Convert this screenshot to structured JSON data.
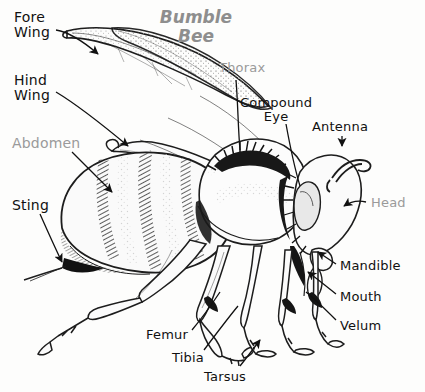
{
  "diagram": {
    "title": "Bumble\nBee",
    "title_color": "#8e8e8e",
    "style": "pen-and-ink line drawing, black on white"
  },
  "labels": [
    {
      "id": "fore-wing",
      "text": "Fore\nWing",
      "color": "#111111",
      "x": 14,
      "y": 10,
      "size": 14,
      "align": "left"
    },
    {
      "id": "hind-wing",
      "text": "Hind\nWing",
      "color": "#111111",
      "x": 14,
      "y": 73,
      "size": 14,
      "align": "left"
    },
    {
      "id": "abdomen",
      "text": "Abdomen",
      "color": "#9a9a9a",
      "x": 12,
      "y": 136,
      "size": 14,
      "align": "left"
    },
    {
      "id": "sting",
      "text": "Sting",
      "color": "#111111",
      "x": 12,
      "y": 198,
      "size": 14,
      "align": "left"
    },
    {
      "id": "thorax",
      "text": "Thorax",
      "color": "#9a9a9a",
      "x": 219,
      "y": 61,
      "size": 13,
      "align": "left"
    },
    {
      "id": "compound-eye",
      "text": "Compound\nEye",
      "color": "#111111",
      "x": 240,
      "y": 96,
      "size": 13,
      "align": "left"
    },
    {
      "id": "antenna",
      "text": "Antenna",
      "color": "#111111",
      "x": 312,
      "y": 120,
      "size": 13,
      "align": "left"
    },
    {
      "id": "head",
      "text": "Head",
      "color": "#9a9a9a",
      "x": 371,
      "y": 196,
      "size": 13,
      "align": "left"
    },
    {
      "id": "mandible",
      "text": "Mandible",
      "color": "#111111",
      "x": 340,
      "y": 259,
      "size": 13,
      "align": "left"
    },
    {
      "id": "mouth",
      "text": "Mouth",
      "color": "#111111",
      "x": 340,
      "y": 290,
      "size": 13,
      "align": "left"
    },
    {
      "id": "velum",
      "text": "Velum",
      "color": "#111111",
      "x": 340,
      "y": 319,
      "size": 13,
      "align": "left"
    },
    {
      "id": "femur",
      "text": "Femur",
      "color": "#111111",
      "x": 146,
      "y": 328,
      "size": 13,
      "align": "left"
    },
    {
      "id": "tibia",
      "text": "Tibia",
      "color": "#111111",
      "x": 172,
      "y": 351,
      "size": 13,
      "align": "left"
    },
    {
      "id": "tarsus",
      "text": "Tarsus",
      "color": "#111111",
      "x": 204,
      "y": 370,
      "size": 13,
      "align": "left"
    }
  ],
  "leaders": [
    {
      "id": "fore-wing-leader",
      "desc": "from Fore Wing text to upper forewing, ends in solid arrowhead"
    },
    {
      "id": "hind-wing-leader",
      "desc": "from Hind Wing text to hindwing base, ends in solid arrowhead"
    },
    {
      "id": "abdomen-leader",
      "desc": "from Abdomen text down-right to striped abdomen, solid arrowhead"
    },
    {
      "id": "sting-leader",
      "desc": "from Sting text down-right to sting tip, solid arrowhead"
    },
    {
      "id": "thorax-leader",
      "desc": "from Thorax text down to furry thorax"
    },
    {
      "id": "compound-eye-leader",
      "desc": "from Compound Eye text down-left to eye"
    },
    {
      "id": "antenna-leader",
      "desc": "short downward arrowhead under Antenna text"
    },
    {
      "id": "head-leader",
      "desc": "left-pointing arrow from Head text to head capsule"
    },
    {
      "id": "mandible-leader",
      "desc": "from Mandible text up-left to mandible, solid arrowhead"
    },
    {
      "id": "mouth-leader",
      "desc": "from Mouth text up-left to mouthparts, solid arrowhead"
    },
    {
      "id": "velum-leader",
      "desc": "from Velum text up-left to velum"
    },
    {
      "id": "femur-leader",
      "desc": "from Femur text up-right to mid-leg femur"
    },
    {
      "id": "tibia-leader",
      "desc": "from Tibia text up-right to tibia segment"
    },
    {
      "id": "tarsus-leader",
      "desc": "upward arrow from Tarsus text to tarsal segments"
    }
  ],
  "anatomy_parts": [
    "Fore Wing",
    "Hind Wing",
    "Abdomen",
    "Sting",
    "Thorax",
    "Compound Eye",
    "Antenna",
    "Head",
    "Mandible",
    "Mouth",
    "Velum",
    "Femur",
    "Tibia",
    "Tarsus"
  ]
}
